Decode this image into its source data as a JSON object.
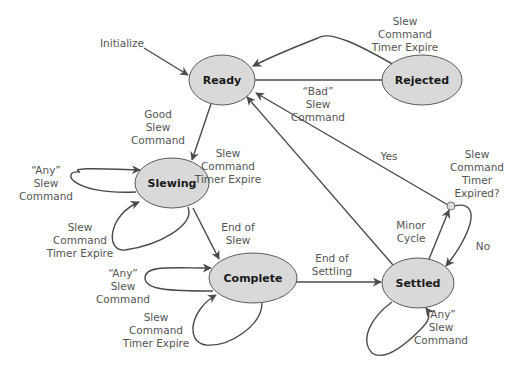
{
  "diagram": {
    "type": "state-machine",
    "colors": {
      "state_fill": "#d9d9d9",
      "state_stroke": "#5a5a5a",
      "edge": "#4a4a4a",
      "label_text": "#555555",
      "state_text": "#1a1a1a"
    },
    "states": [
      {
        "id": "ready",
        "label": "Ready"
      },
      {
        "id": "rejected",
        "label": "Rejected"
      },
      {
        "id": "slewing",
        "label": "Slewing"
      },
      {
        "id": "complete",
        "label": "Complete"
      },
      {
        "id": "settled",
        "label": "Settled"
      }
    ],
    "junction": {
      "id": "timer-check",
      "label_lines": [
        "Slew",
        "Command",
        "Timer",
        "Expired?"
      ]
    },
    "transitions": [
      {
        "id": "initialize",
        "from": "start",
        "to": "ready",
        "label_lines": [
          "Initialize"
        ]
      },
      {
        "id": "ready-to-rejected",
        "from": "ready",
        "to": "rejected",
        "label_lines": [
          "“Bad”",
          "Slew",
          "Command"
        ]
      },
      {
        "id": "rejected-to-ready",
        "from": "rejected",
        "to": "ready",
        "label_lines": [
          "Slew",
          "Command",
          "Timer Expire"
        ]
      },
      {
        "id": "ready-to-slewing",
        "from": "ready",
        "to": "slewing",
        "label_lines": [
          "Good",
          "Slew",
          "Command"
        ]
      },
      {
        "id": "slewing-any-self",
        "from": "slewing",
        "to": "slewing",
        "label_lines": [
          "“Any”",
          "Slew",
          "Command"
        ]
      },
      {
        "id": "slewing-timer-self",
        "from": "slewing",
        "to": "slewing",
        "label_lines": [
          "Slew",
          "Command",
          "Timer Expire"
        ]
      },
      {
        "id": "slewing-to-complete",
        "from": "slewing",
        "to": "complete",
        "label_lines": [
          "End of",
          "Slew"
        ]
      },
      {
        "id": "complete-any-self",
        "from": "complete",
        "to": "complete",
        "label_lines": [
          "“Any”",
          "Slew",
          "Command"
        ]
      },
      {
        "id": "complete-timer-self",
        "from": "complete",
        "to": "complete",
        "label_lines": [
          "Slew",
          "Command",
          "Timer Expire"
        ]
      },
      {
        "id": "complete-to-settled",
        "from": "complete",
        "to": "settled",
        "label_lines": [
          "End of",
          "Settling"
        ]
      },
      {
        "id": "settled-to-ready",
        "from": "settled",
        "to": "ready",
        "label_lines": [
          "Slew",
          "Command",
          "Timer Expire"
        ]
      },
      {
        "id": "settled-any-self",
        "from": "settled",
        "to": "settled",
        "label_lines": [
          "“Any”",
          "Slew",
          "Command"
        ]
      },
      {
        "id": "settled-to-junction",
        "from": "settled",
        "to": "timer-check",
        "label_lines": [
          "Minor",
          "Cycle"
        ]
      },
      {
        "id": "junction-yes",
        "from": "timer-check",
        "to": "ready",
        "label_lines": [
          "Yes"
        ]
      },
      {
        "id": "junction-no",
        "from": "timer-check",
        "to": "settled",
        "label_lines": [
          "No"
        ]
      }
    ]
  }
}
